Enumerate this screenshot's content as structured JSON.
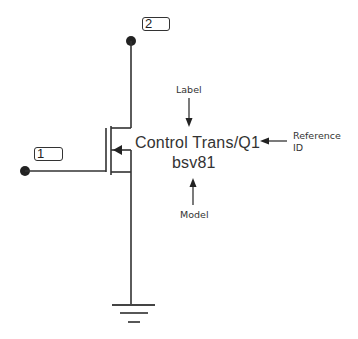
{
  "diagram": {
    "type": "circuit-schematic",
    "component": {
      "kind": "MOSFET transistor",
      "label": "Control Trans",
      "reference_id": "Q1",
      "label_line": "Control Trans/Q1",
      "model": "bsv81"
    },
    "nodes": [
      {
        "id": "2",
        "role": "drain"
      },
      {
        "id": "1",
        "role": "gate"
      }
    ],
    "annotations": {
      "label": "Label",
      "reference_id_line1": "Reference",
      "reference_id_line2": "ID",
      "model": "Model"
    },
    "ground": "ground-symbol",
    "colors": {
      "line": "#333333",
      "background": "#ffffff"
    }
  }
}
